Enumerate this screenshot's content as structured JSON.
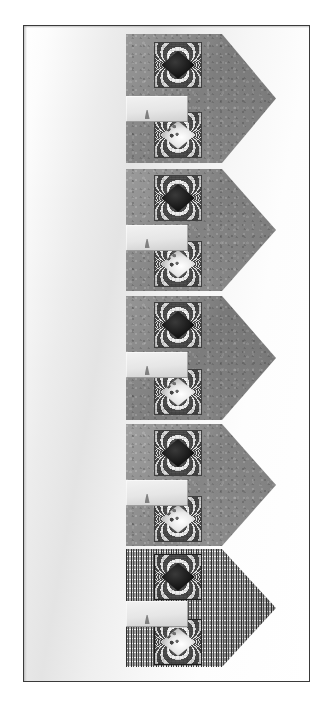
{
  "figure": {
    "title": "",
    "caption": "",
    "plate": {
      "background_style": "light-gray-gradient",
      "frame_color": "#3a3a3a",
      "width_px": 287,
      "height_px": 657
    }
  },
  "panels": [
    {
      "id": "panel-1",
      "label": "",
      "shape": "right-pointing-pentagon",
      "texture": "gray-speckle",
      "fill_color": "#8d8d8d",
      "top_px": 8,
      "height_px": 129,
      "notch": {
        "label": "",
        "top_px": 62,
        "fill_color": "#e9e9e9"
      },
      "insets": [
        {
          "id": "panel-1-inset-upper",
          "label": "",
          "pattern": "dark-diamond-with-fringes",
          "core_color": "#141414",
          "top_px": 8
        },
        {
          "id": "panel-1-inset-lower",
          "label": "",
          "pattern": "bright-diamond-with-fringes",
          "core_color": "#ededed",
          "top_px": 78
        }
      ]
    },
    {
      "id": "panel-2",
      "label": "",
      "shape": "right-pointing-pentagon",
      "texture": "gray-speckle",
      "fill_color": "#8f8f8f",
      "top_px": 143,
      "height_px": 122,
      "notch": {
        "label": "",
        "top_px": 56,
        "fill_color": "#e9e9e9"
      },
      "insets": [
        {
          "id": "panel-2-inset-upper",
          "label": "",
          "pattern": "dark-diamond-with-fringes",
          "core_color": "#161616",
          "top_px": 6
        },
        {
          "id": "panel-2-inset-lower",
          "label": "",
          "pattern": "bright-diamond-with-fringes",
          "core_color": "#eaeaea",
          "top_px": 72
        }
      ]
    },
    {
      "id": "panel-3",
      "label": "",
      "shape": "right-pointing-pentagon",
      "texture": "gray-speckle",
      "fill_color": "#8a8a8a",
      "top_px": 270,
      "height_px": 124,
      "notch": {
        "label": "",
        "top_px": 56,
        "fill_color": "#e6e6e6"
      },
      "insets": [
        {
          "id": "panel-3-inset-upper",
          "label": "",
          "pattern": "dark-diamond-with-fringes",
          "core_color": "#101010",
          "top_px": 6
        },
        {
          "id": "panel-3-inset-lower",
          "label": "",
          "pattern": "bright-diamond-with-fringes",
          "core_color": "#e4e4e4",
          "top_px": 73
        }
      ]
    },
    {
      "id": "panel-4",
      "label": "",
      "shape": "right-pointing-pentagon",
      "texture": "gray-speckle",
      "fill_color": "#969696",
      "top_px": 398,
      "height_px": 122,
      "notch": {
        "label": "",
        "top_px": 56,
        "fill_color": "#ededed"
      },
      "insets": [
        {
          "id": "panel-4-inset-upper",
          "label": "",
          "pattern": "dark-diamond-with-fringes",
          "core_color": "#121212",
          "top_px": 6
        },
        {
          "id": "panel-4-inset-lower",
          "label": "",
          "pattern": "bright-diamond-with-fringes",
          "core_color": "#f0f0f0",
          "top_px": 72
        }
      ]
    },
    {
      "id": "panel-5",
      "label": "",
      "shape": "right-pointing-pentagon",
      "texture": "vertical-dash-stripes",
      "fill_color": "#a3a3a3",
      "top_px": 523,
      "height_px": 118,
      "notch": {
        "label": "",
        "top_px": 52,
        "fill_color": "#c9c9c9"
      },
      "insets": [
        {
          "id": "panel-5-inset-upper",
          "label": "",
          "pattern": "dark-diamond-with-fringes",
          "core_color": "#1b1b1b",
          "top_px": 5
        },
        {
          "id": "panel-5-inset-lower",
          "label": "",
          "pattern": "bright-diamond-with-fringes",
          "core_color": "#f2f2f2",
          "top_px": 70
        }
      ]
    }
  ]
}
